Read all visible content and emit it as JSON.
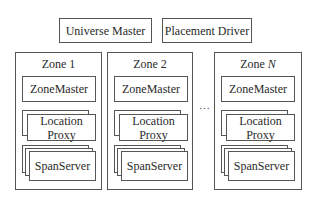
{
  "top": {
    "universe_master": "Universe Master",
    "placement_driver": "Placement Driver"
  },
  "zones": [
    {
      "title": "Zone 1",
      "zone_master": "ZoneMaster",
      "location_proxy": "Location\nProxy",
      "span_server": "SpanServer"
    },
    {
      "title": "Zone 2",
      "zone_master": "ZoneMaster",
      "location_proxy": "Location\nProxy",
      "span_server": "SpanServer"
    },
    {
      "title_prefix": "Zone ",
      "title_var": "N",
      "zone_master": "ZoneMaster",
      "location_proxy": "Location\nProxy",
      "span_server": "SpanServer"
    }
  ],
  "ellipsis": "…",
  "labels": {
    "location": "Location",
    "proxy": "Proxy"
  }
}
